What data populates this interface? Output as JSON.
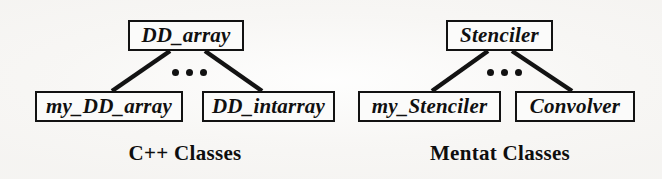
{
  "figure": {
    "background_color": "#f7f6f4",
    "ink_color": "#111111",
    "trees": [
      {
        "id": "cpp",
        "caption": "C++ Classes",
        "root": {
          "label": "DD_array"
        },
        "ellipsis": "•••",
        "children": [
          {
            "label": "my_DD_array"
          },
          {
            "label": "DD_intarray"
          }
        ]
      },
      {
        "id": "mentat",
        "caption": "Mentat Classes",
        "root": {
          "label": "Stenciler"
        },
        "ellipsis": "•••",
        "children": [
          {
            "label": "my_Stenciler"
          },
          {
            "label": "Convolver"
          }
        ]
      }
    ]
  }
}
